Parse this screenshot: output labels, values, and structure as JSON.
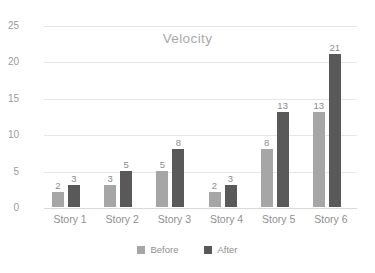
{
  "chart_data": {
    "type": "bar",
    "title": "Velocity",
    "xlabel": "",
    "ylabel": "",
    "categories": [
      "Story 1",
      "Story 2",
      "Story 3",
      "Story 4",
      "Story 5",
      "Story 6"
    ],
    "series": [
      {
        "name": "Before",
        "values": [
          2,
          3,
          5,
          2,
          8,
          13
        ],
        "color": "#a6a6a6"
      },
      {
        "name": "After",
        "values": [
          3,
          5,
          8,
          3,
          13,
          21
        ],
        "color": "#595959"
      }
    ],
    "ylim": [
      0,
      25
    ],
    "yticks": [
      0,
      5,
      10,
      15,
      20,
      25
    ],
    "ytick_labels": [
      "0",
      "5",
      "10",
      "15",
      "20",
      "25"
    ],
    "grid": true,
    "data_labels": true,
    "legend_position": "bottom",
    "colors": {
      "before": "#a6a6a6",
      "after": "#595959",
      "gridline": "#e6e6e6",
      "axis_text": "#9a9a9a",
      "title_text": "#a9a9a9",
      "label_text": "#8c8c8c",
      "background": "#ffffff"
    }
  }
}
